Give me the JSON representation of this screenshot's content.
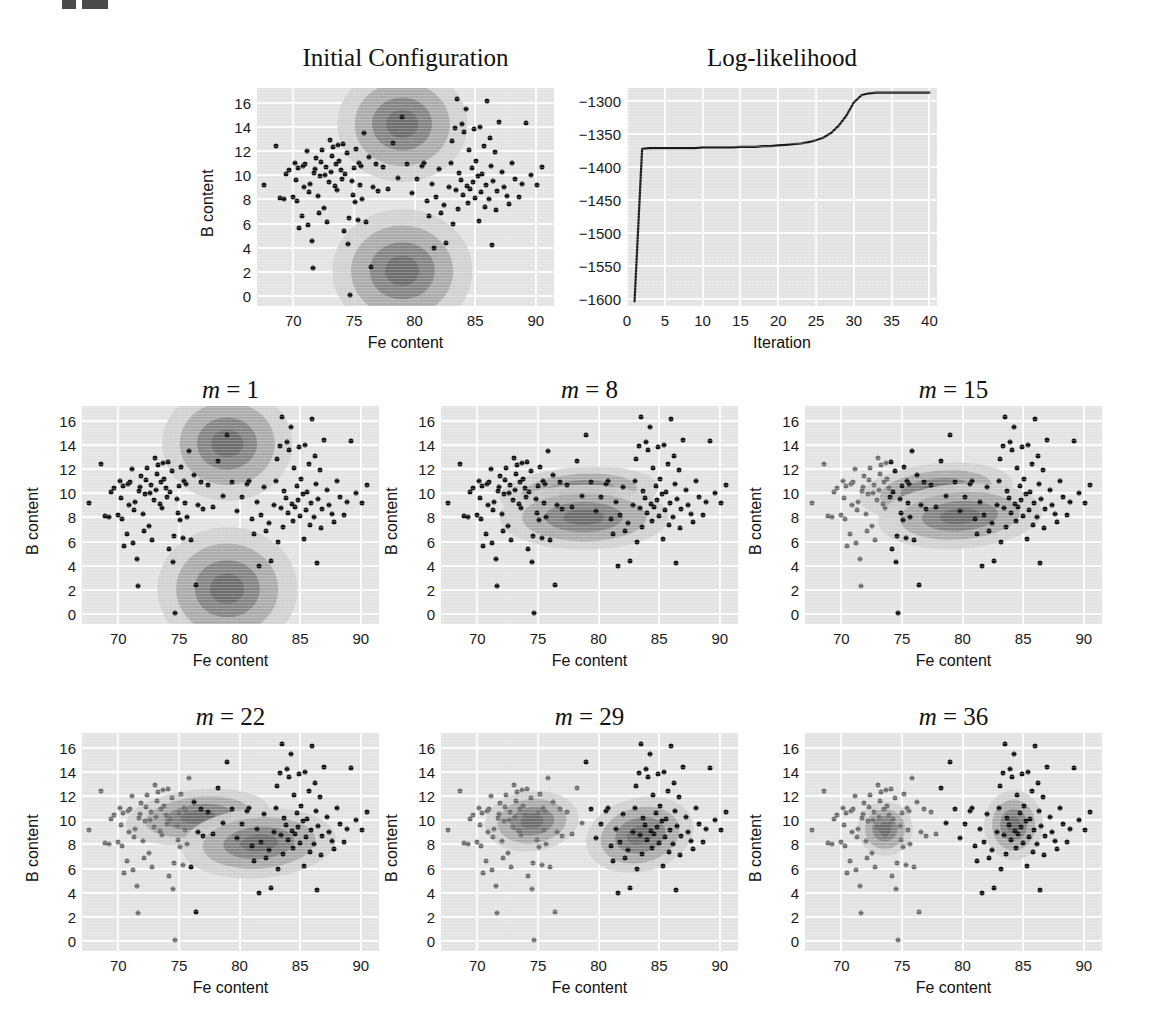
{
  "figure": {
    "mark": "figure-number-mark",
    "width": 1149,
    "height": 1034
  },
  "axes": {
    "xlabel": "Fe content",
    "ylabel": "B content",
    "xticks": [
      "70",
      "75",
      "80",
      "85",
      "90"
    ],
    "xtick_values": [
      70,
      75,
      80,
      85,
      90
    ],
    "yticks": [
      "0",
      "2",
      "4",
      "6",
      "8",
      "10",
      "12",
      "14",
      "16"
    ],
    "ytick_values": [
      0,
      2,
      4,
      6,
      8,
      10,
      12,
      14,
      16
    ],
    "xlim": [
      67,
      91.5
    ],
    "ylim": [
      -0.8,
      17.2
    ]
  },
  "loglik_axes": {
    "xlabel": "Iteration",
    "xticks": [
      "0",
      "5",
      "10",
      "15",
      "20",
      "25",
      "30",
      "35",
      "40"
    ],
    "xtick_values": [
      0,
      5,
      10,
      15,
      20,
      25,
      30,
      35,
      40
    ],
    "yticks": [
      "−1300",
      "−1350",
      "−1400",
      "−1450",
      "−1500",
      "−1550",
      "−1600"
    ],
    "ytick_values": [
      -1300,
      -1350,
      -1400,
      -1450,
      -1500,
      -1550,
      -1600
    ],
    "xlim": [
      0,
      41
    ],
    "ylim": [
      -1610,
      -1280
    ]
  },
  "panels": [
    {
      "id": "initial",
      "title": "Initial Configuration",
      "title_math": false
    },
    {
      "id": "loglik",
      "title": "Log-likelihood",
      "title_math": false
    },
    {
      "id": "m1",
      "title_var": "m",
      "title_eq": " = 1",
      "title_math": true
    },
    {
      "id": "m8",
      "title_var": "m",
      "title_eq": " = 8",
      "title_math": true
    },
    {
      "id": "m15",
      "title_var": "m",
      "title_eq": " = 15",
      "title_math": true
    },
    {
      "id": "m22",
      "title_var": "m",
      "title_eq": " = 22",
      "title_math": true
    },
    {
      "id": "m29",
      "title_var": "m",
      "title_eq": " = 29",
      "title_math": true
    },
    {
      "id": "m36",
      "title_var": "m",
      "title_eq": " = 36",
      "title_math": true
    }
  ],
  "colors": {
    "plot_background": "#e4e4e4",
    "gridline": "#fdfdfd",
    "point_dark": "#141414",
    "point_gray": "#6f6f6f",
    "contour_outer": "#cfcfcf",
    "contour_mid": "#a9a9a9",
    "contour_inner": "#828282",
    "contour_core": "#6e6e6e",
    "curve": "#1a1a1a"
  },
  "chart_data": {
    "type": "scatter",
    "xlabel": "Fe content",
    "ylabel": "B content",
    "xlim": [
      67,
      91.5
    ],
    "ylim": [
      -0.8,
      17.2
    ],
    "grid": true,
    "legend": "none",
    "n_points": 226,
    "points": [
      [
        67.6,
        9.2
      ],
      [
        68.6,
        12.4
      ],
      [
        68.9,
        8.1
      ],
      [
        69.2,
        8.0
      ],
      [
        69.4,
        10.1
      ],
      [
        69.6,
        10.4
      ],
      [
        70.0,
        8.2
      ],
      [
        70.1,
        11.0
      ],
      [
        70.2,
        9.6
      ],
      [
        70.3,
        7.9
      ],
      [
        70.4,
        10.6
      ],
      [
        70.5,
        5.6
      ],
      [
        70.7,
        6.6
      ],
      [
        70.8,
        10.8
      ],
      [
        70.9,
        9.0
      ],
      [
        71.0,
        10.9
      ],
      [
        71.1,
        12.0
      ],
      [
        71.2,
        5.9
      ],
      [
        71.3,
        8.6
      ],
      [
        71.4,
        9.3
      ],
      [
        71.5,
        4.6
      ],
      [
        71.6,
        2.3
      ],
      [
        71.7,
        10.2
      ],
      [
        71.8,
        10.5
      ],
      [
        71.9,
        11.4
      ],
      [
        72.0,
        8.3
      ],
      [
        72.1,
        6.9
      ],
      [
        72.2,
        9.9
      ],
      [
        72.3,
        11.1
      ],
      [
        72.4,
        12.1
      ],
      [
        72.5,
        7.3
      ],
      [
        72.6,
        10.0
      ],
      [
        72.7,
        10.7
      ],
      [
        72.8,
        6.1
      ],
      [
        72.9,
        9.4
      ],
      [
        73.0,
        12.9
      ],
      [
        73.1,
        10.3
      ],
      [
        73.2,
        11.6
      ],
      [
        73.3,
        12.3
      ],
      [
        73.4,
        9.1
      ],
      [
        73.5,
        10.9
      ],
      [
        73.6,
        8.8
      ],
      [
        73.7,
        12.5
      ],
      [
        73.8,
        11.2
      ],
      [
        73.9,
        10.4
      ],
      [
        74.0,
        9.7
      ],
      [
        74.1,
        12.6
      ],
      [
        74.2,
        5.4
      ],
      [
        74.3,
        10.1
      ],
      [
        74.4,
        11.8
      ],
      [
        74.5,
        4.3
      ],
      [
        74.6,
        6.5
      ],
      [
        74.7,
        0.1
      ],
      [
        74.8,
        9.5
      ],
      [
        74.9,
        8.4
      ],
      [
        75.0,
        10.6
      ],
      [
        75.1,
        7.8
      ],
      [
        75.2,
        12.2
      ],
      [
        75.3,
        6.3
      ],
      [
        75.4,
        11.0
      ],
      [
        75.5,
        9.2
      ],
      [
        75.6,
        10.8
      ],
      [
        75.7,
        8.0
      ],
      [
        75.8,
        13.5
      ],
      [
        76.0,
        6.1
      ],
      [
        76.2,
        11.5
      ],
      [
        76.4,
        2.4
      ],
      [
        76.6,
        9.0
      ],
      [
        76.8,
        10.9
      ],
      [
        77.0,
        8.7
      ],
      [
        77.4,
        10.7
      ],
      [
        77.8,
        8.9
      ],
      [
        78.2,
        12.7
      ],
      [
        78.6,
        9.8
      ],
      [
        79.0,
        14.8
      ],
      [
        79.4,
        10.9
      ],
      [
        79.8,
        8.5
      ],
      [
        80.2,
        9.7
      ],
      [
        80.6,
        10.8
      ],
      [
        80.8,
        11.0
      ],
      [
        81.0,
        7.9
      ],
      [
        81.2,
        6.6
      ],
      [
        81.4,
        9.3
      ],
      [
        81.6,
        4.0
      ],
      [
        81.8,
        8.2
      ],
      [
        82.0,
        10.5
      ],
      [
        82.2,
        6.9
      ],
      [
        82.4,
        7.5
      ],
      [
        82.6,
        4.4
      ],
      [
        82.8,
        9.0
      ],
      [
        83.0,
        11.0
      ],
      [
        83.1,
        12.8
      ],
      [
        83.2,
        6.0
      ],
      [
        83.3,
        13.9
      ],
      [
        83.4,
        8.8
      ],
      [
        83.5,
        16.3
      ],
      [
        83.6,
        7.2
      ],
      [
        83.7,
        10.2
      ],
      [
        83.8,
        9.6
      ],
      [
        83.9,
        14.2
      ],
      [
        84.0,
        8.4
      ],
      [
        84.1,
        13.6
      ],
      [
        84.2,
        15.5
      ],
      [
        84.3,
        9.1
      ],
      [
        84.4,
        7.7
      ],
      [
        84.5,
        12.1
      ],
      [
        84.6,
        8.9
      ],
      [
        84.7,
        10.6
      ],
      [
        84.8,
        9.4
      ],
      [
        84.9,
        13.8
      ],
      [
        85.0,
        8.1
      ],
      [
        85.1,
        11.2
      ],
      [
        85.2,
        9.9
      ],
      [
        85.3,
        6.2
      ],
      [
        85.4,
        14.0
      ],
      [
        85.5,
        8.6
      ],
      [
        85.6,
        10.1
      ],
      [
        85.7,
        12.4
      ],
      [
        85.8,
        7.4
      ],
      [
        85.9,
        9.2
      ],
      [
        86.0,
        16.1
      ],
      [
        86.1,
        8.0
      ],
      [
        86.2,
        13.1
      ],
      [
        86.3,
        10.8
      ],
      [
        86.4,
        4.2
      ],
      [
        86.5,
        9.5
      ],
      [
        86.6,
        11.9
      ],
      [
        86.7,
        7.1
      ],
      [
        86.8,
        8.7
      ],
      [
        87.0,
        14.4
      ],
      [
        87.2,
        10.3
      ],
      [
        87.4,
        9.0
      ],
      [
        87.6,
        8.3
      ],
      [
        87.8,
        7.6
      ],
      [
        88.0,
        11.0
      ],
      [
        88.3,
        9.7
      ],
      [
        88.6,
        8.2
      ],
      [
        88.9,
        9.3
      ],
      [
        89.2,
        14.3
      ],
      [
        89.6,
        10.0
      ],
      [
        90.1,
        9.2
      ],
      [
        90.5,
        10.7
      ]
    ],
    "cluster_assignment_note": "Left cluster drawn gray, right cluster drawn black once separated",
    "panels": [
      {
        "id": "initial",
        "title": "Initial Configuration",
        "components": [
          {
            "mean": [
              79.0,
              14.2
            ],
            "sx": 2.6,
            "sy": 2.3,
            "rot": 0
          },
          {
            "mean": [
              79.0,
              2.1
            ],
            "sx": 2.8,
            "sy": 2.5,
            "rot": 0
          }
        ]
      },
      {
        "id": "m1",
        "iteration": 1,
        "components": [
          {
            "mean": [
              79.0,
              14.1
            ],
            "sx": 2.6,
            "sy": 2.3,
            "rot": 0
          },
          {
            "mean": [
              79.0,
              2.1
            ],
            "sx": 2.8,
            "sy": 2.5,
            "rot": 0
          }
        ]
      },
      {
        "id": "m8",
        "iteration": 8,
        "components": [
          {
            "mean": [
              78.4,
              10.1
            ],
            "sx": 3.2,
            "sy": 1.0,
            "rot": -4
          },
          {
            "mean": [
              78.8,
              8.0
            ],
            "sx": 3.4,
            "sy": 1.3,
            "rot": 0
          }
        ]
      },
      {
        "id": "m15",
        "iteration": 15,
        "components": [
          {
            "mean": [
              77.8,
              10.2
            ],
            "sx": 3.1,
            "sy": 1.1,
            "rot": -6
          },
          {
            "mean": [
              79.8,
              8.1
            ],
            "sx": 3.3,
            "sy": 1.3,
            "rot": -4
          }
        ]
      },
      {
        "id": "m22",
        "iteration": 22,
        "components": [
          {
            "mean": [
              76.6,
              10.3
            ],
            "sx": 2.9,
            "sy": 1.1,
            "rot": -6
          },
          {
            "mean": [
              81.6,
              8.1
            ],
            "sx": 3.1,
            "sy": 1.4,
            "rot": -4
          }
        ]
      },
      {
        "id": "m29",
        "iteration": 29,
        "components": [
          {
            "mean": [
              74.5,
              9.9
            ],
            "sx": 1.9,
            "sy": 1.2,
            "rot": -6
          },
          {
            "mean": [
              83.4,
              8.8
            ],
            "sx": 2.2,
            "sy": 1.5,
            "rot": -14
          }
        ]
      },
      {
        "id": "m36",
        "iteration": 36,
        "components": [
          {
            "mean": [
              73.6,
              9.3
            ],
            "sx": 1.1,
            "sy": 1.1,
            "rot": 0
          },
          {
            "mean": [
              84.2,
              9.6
            ],
            "sx": 1.2,
            "sy": 1.4,
            "rot": 0
          }
        ]
      }
    ],
    "loglikelihood": {
      "type": "line",
      "title": "Log-likelihood",
      "xlabel": "Iteration",
      "ylabel": "",
      "xlim": [
        0,
        41
      ],
      "ylim": [
        -1610,
        -1280
      ],
      "x": [
        1,
        2,
        3,
        4,
        5,
        6,
        7,
        8,
        9,
        10,
        11,
        12,
        13,
        14,
        15,
        16,
        17,
        18,
        19,
        20,
        21,
        22,
        23,
        24,
        25,
        26,
        27,
        28,
        29,
        30,
        31,
        32,
        33,
        34,
        35,
        36,
        37,
        38,
        39,
        40
      ],
      "y": [
        -1603,
        -1372,
        -1371,
        -1371,
        -1371,
        -1371,
        -1371,
        -1371,
        -1371,
        -1370,
        -1370,
        -1370,
        -1370,
        -1370,
        -1369,
        -1369,
        -1369,
        -1368,
        -1368,
        -1367,
        -1366,
        -1365,
        -1364,
        -1362,
        -1359,
        -1355,
        -1348,
        -1337,
        -1322,
        -1302,
        -1291,
        -1288,
        -1287,
        -1287,
        -1287,
        -1287,
        -1287,
        -1287,
        -1287,
        -1287
      ]
    }
  }
}
